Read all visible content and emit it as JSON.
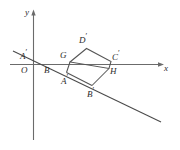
{
  "figure": {
    "kind": "coordinate-geometry-diagram",
    "background_color": "#ffffff",
    "axis_color": "#6b6b6b",
    "line_color": "#4a4a4a",
    "square_color": "#555555",
    "label_color": "#2b2b2b",
    "axes": {
      "x_label": "x",
      "y_label": "y",
      "origin_label": "O",
      "x_axis": {
        "x1": 10,
        "y1": 64.5,
        "x2": 160,
        "y2": 64.5
      },
      "y_axis": {
        "x1": 33.5,
        "y1": 14,
        "x2": 33.5,
        "y2": 140
      },
      "x_arrow": {
        "tip_x": 164,
        "tip_y": 64.5
      },
      "y_arrow": {
        "tip_x": 33.5,
        "tip_y": 10
      }
    },
    "transversal": {
      "name": "slanted-line",
      "x1": 13,
      "y1": 51,
      "x2": 161,
      "y2": 122
    },
    "square": {
      "name": "tilted-square",
      "vertices": [
        {
          "label": "G",
          "x": 70,
          "y": 62
        },
        {
          "label": "D'",
          "x": 86.5,
          "y": 48.5
        },
        {
          "label": "C'",
          "x": 111,
          "y": 61.5
        },
        {
          "label": "H",
          "x": 109,
          "y": 68.5
        }
      ]
    },
    "point_labels": [
      {
        "name": "point-label-a-prime-left",
        "base": "A",
        "prime": true,
        "x": 20,
        "y": 50
      },
      {
        "name": "point-label-o",
        "base": "O",
        "prime": false,
        "x": 22,
        "y": 66
      },
      {
        "name": "point-label-b",
        "base": "B",
        "prime": false,
        "x": 44,
        "y": 66
      },
      {
        "name": "point-label-g",
        "base": "G",
        "prime": false,
        "x": 61,
        "y": 53
      },
      {
        "name": "point-label-a-prime",
        "base": "A",
        "prime": true,
        "x": 61,
        "y": 74
      },
      {
        "name": "point-label-d-prime",
        "base": "D",
        "prime": true,
        "x": 80,
        "y": 34
      },
      {
        "name": "point-label-c-prime",
        "base": "C",
        "prime": true,
        "x": 113,
        "y": 52
      },
      {
        "name": "point-label-h",
        "base": "H",
        "prime": false,
        "x": 110,
        "y": 68
      },
      {
        "name": "point-label-b-prime",
        "base": "B",
        "prime": true,
        "x": 88,
        "y": 88
      }
    ]
  }
}
